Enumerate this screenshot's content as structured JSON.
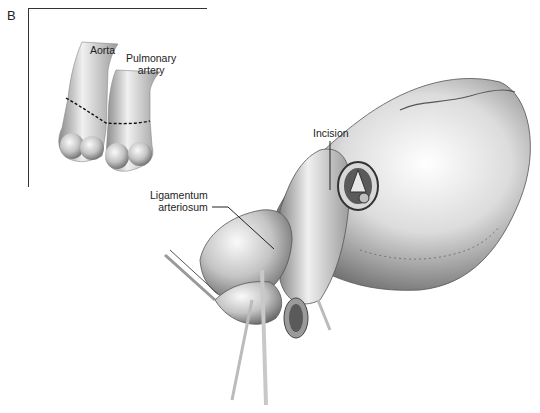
{
  "figure": {
    "panel_letter": "B",
    "inset": {
      "labels": {
        "aorta": "Aorta",
        "pulmonary_line1": "Pulmonary",
        "pulmonary_line2": "artery"
      }
    },
    "main": {
      "labels": {
        "incision": "Incision",
        "ligamentum_line1": "Ligamentum",
        "ligamentum_line2": "arteriosum"
      }
    },
    "colors": {
      "ink": "#222222",
      "tissue_dark": "#6e6e6e",
      "tissue_mid": "#a8a8a8",
      "tissue_light": "#e2e2e2"
    }
  }
}
